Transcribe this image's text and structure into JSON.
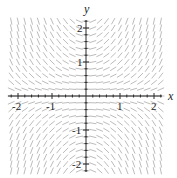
{
  "figure": {
    "type": "slope-field",
    "equation": "dy/dx = xy",
    "x_axis_label": "x",
    "y_axis_label": "y",
    "x_ticks": [
      {
        "value": -2,
        "label": "-2"
      },
      {
        "value": -1,
        "label": "-1"
      },
      {
        "value": 1,
        "label": "1"
      },
      {
        "value": 2,
        "label": "2"
      }
    ],
    "y_ticks": [
      {
        "value": 2,
        "label": "2"
      },
      {
        "value": 1,
        "label": "1"
      },
      {
        "value": -1,
        "label": "-1"
      },
      {
        "value": -2,
        "label": "-2"
      }
    ],
    "xlim": [
      -2.2,
      2.2
    ],
    "ylim": [
      -2.2,
      2.2
    ],
    "colors": {
      "segments": "#b4b4b4",
      "axes": "#2a2a2a",
      "text": "#222222",
      "background": "#ffffff"
    }
  }
}
